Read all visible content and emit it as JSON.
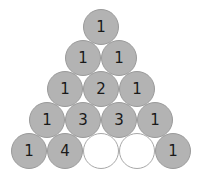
{
  "diagram": {
    "type": "pascal-triangle-puzzle",
    "colors": {
      "filled": "#b3b3b3",
      "empty": "#ffffff",
      "border": "#9a9a9a",
      "text": "#1a1a1a"
    },
    "rows": [
      [
        "1"
      ],
      [
        "1",
        "1"
      ],
      [
        "1",
        "2",
        "1"
      ],
      [
        "1",
        "3",
        "3",
        "1"
      ],
      [
        "1",
        "4",
        "",
        "",
        "1"
      ]
    ]
  }
}
